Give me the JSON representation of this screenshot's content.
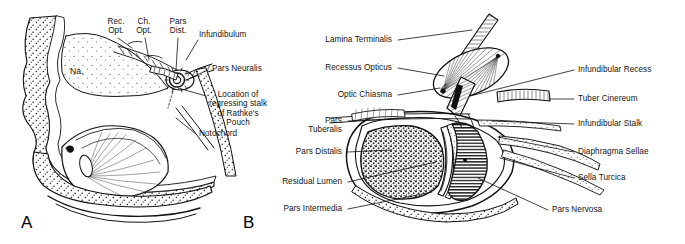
{
  "figure": {
    "background_color": "#ffffff",
    "ink_color": "#111111"
  },
  "panels": [
    {
      "letter": "A",
      "name": "panel-a-embryonic-sagittal-section"
    },
    {
      "letter": "B",
      "name": "panel-b-pituitary-detail"
    }
  ],
  "panel_a": {
    "letter": "A",
    "interior_label": "Na.",
    "labels": [
      {
        "id": "rec-opt",
        "text": "Rec.\nOpt.",
        "line1": "Rec.",
        "line2": "Opt."
      },
      {
        "id": "ch-opt",
        "text": "Ch.\nOpt.",
        "line1": "Ch.",
        "line2": "Opt."
      },
      {
        "id": "pars-dist",
        "text": "Pars\nDist.",
        "line1": "Pars",
        "line2": "Dist."
      },
      {
        "id": "infundibulum",
        "text": "Infundibulum"
      },
      {
        "id": "pars-neuralis",
        "text": "Pars Neuralis"
      },
      {
        "id": "rathkes-pouch",
        "text": "Location of regressing stalk of Rathke's Pouch",
        "line1": "Location of",
        "line2": "regressing stalk",
        "line3": "of Rathke's",
        "line4": "Pouch"
      },
      {
        "id": "notochord",
        "text": "Notochord"
      }
    ]
  },
  "panel_b": {
    "letter": "B",
    "labels_left": [
      {
        "id": "lamina-terminalis",
        "text": "Lamina Terminalis"
      },
      {
        "id": "recessus-opticus",
        "text": "Recessus Opticus"
      },
      {
        "id": "optic-chiasma",
        "text": "Optic Chiasma"
      },
      {
        "id": "pars-tuberalis",
        "text": "Pars Tuberalis",
        "line1": "Pars",
        "line2": "Tuberalis"
      },
      {
        "id": "pars-distalis",
        "text": "Pars Distalis"
      },
      {
        "id": "residual-lumen",
        "text": "Residual Lumen"
      },
      {
        "id": "pars-intermedia",
        "text": "Pars Intermedia"
      }
    ],
    "labels_right": [
      {
        "id": "infundibular-recess",
        "text": "Infundibular Recess"
      },
      {
        "id": "tuber-cinereum",
        "text": "Tuber Cinereum"
      },
      {
        "id": "infundibular-stalk",
        "text": "Infundibular Stalk"
      },
      {
        "id": "diaphragma-sellae",
        "text": "Diaphragma Sellae"
      },
      {
        "id": "sella-turcica",
        "text": "Sella Turcica"
      },
      {
        "id": "pars-nervosa",
        "text": "Pars Nervosa"
      }
    ]
  }
}
